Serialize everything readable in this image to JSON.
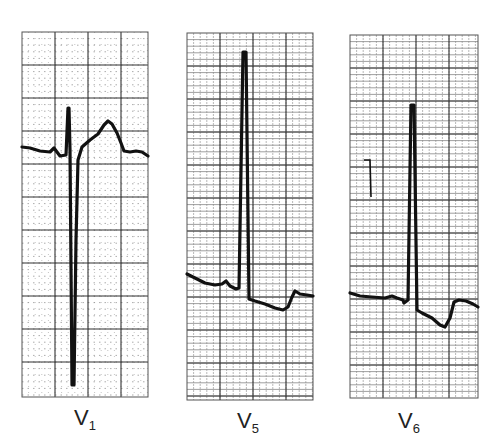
{
  "figure": {
    "panels": [
      {
        "lead": "V",
        "lead_sub": "1",
        "box": {
          "x": 22,
          "y": 32,
          "w": 126,
          "h": 365
        },
        "major_grid": 33,
        "minor_style": "dotted",
        "trace": "M22,147 L30,148 L40,151 L50,152 L54,148 L57,152 L60,156 L66,155 L68,108 L69,108 L70,150 L72,385 L74,385 L76,240 L78,160 L82,147 L90,140 L98,134 L104,125 L108,121 L112,124 L117,133 L121,143 L124,151 L130,152 L136,151 L142,152 L148,156",
        "label_pos": {
          "x": 74,
          "y": 405
        }
      },
      {
        "lead": "V",
        "lead_sub": "5",
        "box": {
          "x": 187,
          "y": 33,
          "w": 126,
          "h": 367
        },
        "major_grid": 33,
        "minor_style": "dense",
        "trace": "M187,274 L195,278 L205,283 L215,285 L222,284 L226,281 L230,286 L236,289 L239,288 L243,52 L246,52 L249,299 L255,301 L265,304 L275,308 L283,310 L288,307 L292,297 L295,291 L300,294 L307,295 L313,296",
        "label_pos": {
          "x": 237,
          "y": 408
        }
      },
      {
        "lead": "V",
        "lead_sub": "6",
        "box": {
          "x": 350,
          "y": 35,
          "w": 128,
          "h": 363
        },
        "major_grid": 33,
        "minor_style": "dense",
        "trace": "M350,293 L360,296 L372,297 L385,298 L392,296 L397,298 L403,300 L404,303 L408,300 L411,105 L414,105 L417,310 L422,313 L432,318 L440,325 L445,327 L450,318 L454,302 L459,300 L466,301 L473,304 L478,307",
        "label_pos": {
          "x": 398,
          "y": 408
        },
        "annotation_mark": {
          "x1": 368,
          "y1": 160,
          "x2": 371,
          "y2": 197
        }
      }
    ],
    "colors": {
      "background": "#ffffff",
      "grid_major": "#333333",
      "grid_minor": "#888888",
      "trace": "#111111",
      "label": "#222222"
    }
  }
}
